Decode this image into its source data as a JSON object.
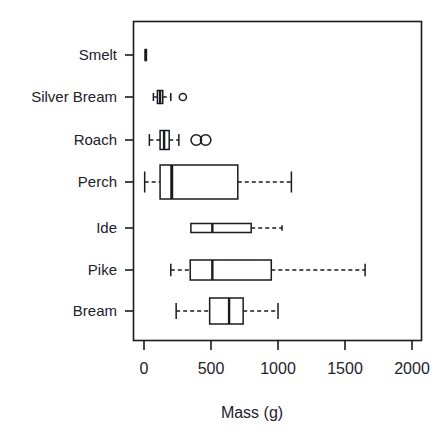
{
  "chart_data": {
    "type": "box",
    "title": "",
    "subtitle": "",
    "orientation": "horizontal",
    "xlabel": "Mass (g)",
    "ylabel": "",
    "xlim": [
      -70,
      2130
    ],
    "xticks": [
      0,
      500,
      1000,
      1500,
      2000
    ],
    "xtick_labels": [
      "0",
      "500",
      "1000",
      "1500",
      "2000"
    ],
    "grid": false,
    "legend": "none",
    "frame": "box",
    "categories": [
      "Smelt",
      "Silver Bream",
      "Roach",
      "Perch",
      "Ide",
      "Pike",
      "Bream"
    ],
    "boxes": [
      {
        "category": "Smelt",
        "whisker_low": 6,
        "q1": 9,
        "median": 13,
        "q3": 17,
        "whisker_high": 19,
        "outliers": []
      },
      {
        "category": "Silver Bream",
        "whisker_low": 70,
        "q1": 100,
        "median": 120,
        "q3": 140,
        "whisker_high": 200,
        "outliers": [
          290
        ]
      },
      {
        "category": "Roach",
        "whisker_low": 40,
        "q1": 120,
        "median": 150,
        "q3": 188,
        "whisker_high": 260,
        "outliers": [
          390,
          460
        ]
      },
      {
        "category": "Perch",
        "whisker_low": 5,
        "q1": 120,
        "median": 207,
        "q3": 700,
        "whisker_high": 1100,
        "outliers": []
      },
      {
        "category": "Ide",
        "whisker_low": 350,
        "q1": 350,
        "median": 510,
        "q3": 800,
        "whisker_high": 1030,
        "outliers": []
      },
      {
        "category": "Pike",
        "whisker_low": 200,
        "q1": 345,
        "median": 510,
        "q3": 950,
        "whisker_high": 1650,
        "outliers": []
      },
      {
        "category": "Bream",
        "whisker_low": 240,
        "q1": 490,
        "median": 635,
        "q3": 740,
        "whisker_high": 1000,
        "outliers": []
      }
    ],
    "colors": {
      "line": "#1a1a22",
      "box_fill": "#ffffff",
      "background": "#ffffff",
      "text": "#22222c"
    }
  }
}
